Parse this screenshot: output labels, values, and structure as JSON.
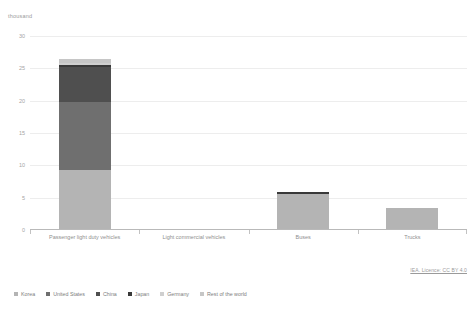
{
  "chart_data": {
    "type": "bar",
    "subtype": "stacked-bar",
    "title": "",
    "unit_label": "thousand",
    "xlabel": "",
    "ylabel": "",
    "ylim": [
      0,
      30
    ],
    "yticks": [
      30,
      25,
      20,
      15,
      10,
      5,
      0
    ],
    "ytick_labels": [
      "30",
      "25",
      "20",
      "15",
      "10",
      "5",
      "0"
    ],
    "grid": true,
    "legend_position": "bottom",
    "categories": [
      "Passenger light duty vehicles",
      "Light commercial vehicles",
      "Buses",
      "Trucks"
    ],
    "series": [
      {
        "name": "Korea",
        "color": "#b4b4b4",
        "values": [
          9.3,
          0.02,
          5.6,
          3.4
        ]
      },
      {
        "name": "United States",
        "color": "#6f6f6f",
        "values": [
          10.5,
          0.0,
          0.0,
          0.0
        ]
      },
      {
        "name": "China",
        "color": "#4f4f4f",
        "values": [
          5.4,
          0.0,
          0.0,
          0.0
        ]
      },
      {
        "name": "Japan",
        "color": "#393939",
        "values": [
          0.3,
          0.0,
          0.25,
          0.0
        ]
      },
      {
        "name": "Germany",
        "color": "#cfcfcf",
        "values": [
          0.4,
          0.0,
          0.0,
          0.0
        ]
      },
      {
        "name": "Rest of the world",
        "color": "#c6c6c6",
        "values": [
          0.5,
          0.0,
          0.0,
          0.0
        ]
      }
    ],
    "totals": [
      26.4,
      0.02,
      5.85,
      3.4
    ]
  },
  "attribution": {
    "text": "IEA. Licence: CC BY 4.0"
  },
  "colors": {
    "grid": "#ededed",
    "axis": "#b9b9b9",
    "tick_text": "#a5a5a5",
    "category_text": "#8f8f8f",
    "legend_text": "#7d7d7d",
    "unit_text": "#9a9a9a",
    "background": "#ffffff"
  }
}
